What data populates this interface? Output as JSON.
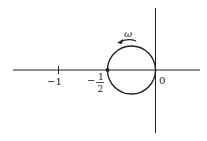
{
  "diagram": {
    "type": "nyquist-plot",
    "colors": {
      "stroke": "#222222",
      "background": "#ffffff"
    },
    "labels": {
      "minus_one": "−1",
      "minus_half_sign": "−",
      "minus_half_num": "1",
      "minus_half_den": "2",
      "origin": "0",
      "omega": "ω"
    },
    "circle": {
      "center_re": -0.25,
      "radius": 0.25,
      "direction": "counterclockwise"
    }
  }
}
